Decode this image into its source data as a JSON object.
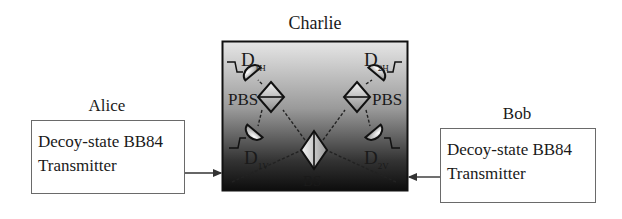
{
  "charlie": {
    "title": "Charlie",
    "components": {
      "pbs_left_label": "PBS",
      "pbs_right_label": "PBS",
      "bs_label": "BS",
      "detectors": [
        {
          "name": "D",
          "sub": "1H"
        },
        {
          "name": "D",
          "sub": "2H"
        },
        {
          "name": "D",
          "sub": "1V"
        },
        {
          "name": "D",
          "sub": "2V"
        }
      ]
    },
    "colors": {
      "gradient_top": "#e6e6e6",
      "gradient_bottom": "#0d0d0d"
    }
  },
  "alice": {
    "title": "Alice",
    "box_line1": "Decoy-state BB84",
    "box_line2": "Transmitter"
  },
  "bob": {
    "title": "Bob",
    "box_line1": "Decoy-state BB84",
    "box_line2": "Transmitter"
  }
}
